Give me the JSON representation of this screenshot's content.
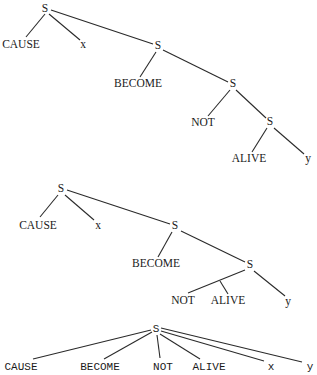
{
  "colors": {
    "background": "#ffffff",
    "line": "#2a2a2a",
    "text": "#1a1a1a"
  },
  "trees": [
    {
      "id": "tree-1",
      "description": "Fully nested decomposition: CAUSE x (BECOME (NOT (ALIVE y)))",
      "font": "serif",
      "nodes": [
        {
          "id": "t1-s1",
          "label": "S",
          "x": 45,
          "y": 12
        },
        {
          "id": "t1-cause",
          "label": "CAUSE",
          "x": 21,
          "y": 48
        },
        {
          "id": "t1-x",
          "label": "x",
          "x": 83,
          "y": 48
        },
        {
          "id": "t1-s2",
          "label": "S",
          "x": 158,
          "y": 49
        },
        {
          "id": "t1-become",
          "label": "BECOME",
          "x": 138,
          "y": 87
        },
        {
          "id": "t1-s3",
          "label": "S",
          "x": 233,
          "y": 87
        },
        {
          "id": "t1-not",
          "label": "NOT",
          "x": 203,
          "y": 126
        },
        {
          "id": "t1-s4",
          "label": "S",
          "x": 270,
          "y": 125
        },
        {
          "id": "t1-alive",
          "label": "ALIVE",
          "x": 249,
          "y": 162
        },
        {
          "id": "t1-y",
          "label": "y",
          "x": 308,
          "y": 162
        }
      ],
      "edges": [
        {
          "from": [
            45,
            14
          ],
          "to": [
            26,
            37
          ]
        },
        {
          "from": [
            49,
            14
          ],
          "to": [
            80,
            40
          ]
        },
        {
          "from": [
            51,
            10
          ],
          "to": [
            153,
            44
          ]
        },
        {
          "from": [
            156,
            52
          ],
          "to": [
            140,
            77
          ]
        },
        {
          "from": [
            163,
            50
          ],
          "to": [
            228,
            82
          ]
        },
        {
          "from": [
            230,
            90
          ],
          "to": [
            208,
            116
          ]
        },
        {
          "from": [
            236,
            90
          ],
          "to": [
            266,
            118
          ]
        },
        {
          "from": [
            267,
            128
          ],
          "to": [
            252,
            152
          ]
        },
        {
          "from": [
            274,
            128
          ],
          "to": [
            304,
            154
          ]
        }
      ]
    },
    {
      "id": "tree-2",
      "description": "Partially flattened: CAUSE x (BECOME (NOT ALIVE y))",
      "font": "serif",
      "nodes": [
        {
          "id": "t2-s1",
          "label": "S",
          "x": 61,
          "y": 192
        },
        {
          "id": "t2-cause",
          "label": "CAUSE",
          "x": 38,
          "y": 229
        },
        {
          "id": "t2-x",
          "label": "x",
          "x": 98,
          "y": 229
        },
        {
          "id": "t2-s2",
          "label": "S",
          "x": 175,
          "y": 229
        },
        {
          "id": "t2-become",
          "label": "BECOME",
          "x": 156,
          "y": 267
        },
        {
          "id": "t2-s3",
          "label": "S",
          "x": 250,
          "y": 268
        },
        {
          "id": "t2-not",
          "label": "NOT",
          "x": 183,
          "y": 304
        },
        {
          "id": "t2-alive",
          "label": "ALIVE",
          "x": 228,
          "y": 304
        },
        {
          "id": "t2-y",
          "label": "y",
          "x": 288,
          "y": 305
        }
      ],
      "edges": [
        {
          "from": [
            58,
            195
          ],
          "to": [
            40,
            217
          ]
        },
        {
          "from": [
            65,
            195
          ],
          "to": [
            94,
            220
          ]
        },
        {
          "from": [
            67,
            190
          ],
          "to": [
            170,
            224
          ]
        },
        {
          "from": [
            172,
            232
          ],
          "to": [
            158,
            257
          ]
        },
        {
          "from": [
            181,
            231
          ],
          "to": [
            245,
            262
          ]
        },
        {
          "from": [
            245,
            270
          ],
          "to": [
            188,
            293
          ]
        },
        {
          "from": [
            220,
            281
          ],
          "to": [
            228,
            294
          ]
        },
        {
          "from": [
            254,
            271
          ],
          "to": [
            285,
            296
          ]
        }
      ]
    },
    {
      "id": "tree-3",
      "description": "Completely flat: S dominates all six elements",
      "font": "mono",
      "nodes": [
        {
          "id": "t3-s",
          "label": "S",
          "x": 156,
          "y": 332
        },
        {
          "id": "t3-cause",
          "label": "CAUSE",
          "x": 21,
          "y": 370
        },
        {
          "id": "t3-become",
          "label": "BECOME",
          "x": 100,
          "y": 370
        },
        {
          "id": "t3-not",
          "label": "NOT",
          "x": 163,
          "y": 370
        },
        {
          "id": "t3-alive",
          "label": "ALIVE",
          "x": 209,
          "y": 370
        },
        {
          "id": "t3-x",
          "label": "x",
          "x": 271,
          "y": 370
        },
        {
          "id": "t3-y",
          "label": "y",
          "x": 310,
          "y": 370
        }
      ],
      "edges": [
        {
          "from": [
            151,
            330
          ],
          "to": [
            33,
            359
          ]
        },
        {
          "from": [
            152,
            332
          ],
          "to": [
            104,
            359
          ]
        },
        {
          "from": [
            157,
            335
          ],
          "to": [
            160,
            358
          ]
        },
        {
          "from": [
            160,
            334
          ],
          "to": [
            200,
            359
          ]
        },
        {
          "from": [
            161,
            331
          ],
          "to": [
            264,
            361
          ]
        },
        {
          "from": [
            161,
            328
          ],
          "to": [
            302,
            362
          ]
        }
      ]
    }
  ]
}
